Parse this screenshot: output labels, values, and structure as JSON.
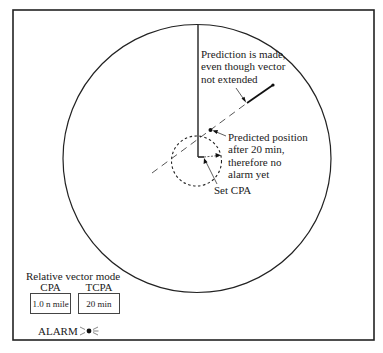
{
  "diagram": {
    "type": "radar-display",
    "annotations": {
      "prediction_note": [
        "Prediction is made,",
        "even though vector",
        "not extended"
      ],
      "predicted_position_note": [
        "Predicted position",
        "after 20 min,",
        "therefore no",
        "alarm yet"
      ],
      "set_cpa": "Set CPA"
    },
    "panel": {
      "mode": "Relative vector mode",
      "cpa_label": "CPA",
      "tcpa_label": "TCPA",
      "cpa_value": "1.0 n mile",
      "tcpa_value": "20 min",
      "alarm_label": "ALARM",
      "alarm_icon": "blinking-light-icon"
    },
    "colors": {
      "line": "#1a1a1a",
      "background": "#ffffff"
    }
  }
}
